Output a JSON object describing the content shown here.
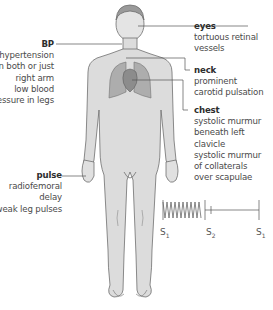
{
  "diagram": {
    "labels": [
      {
        "id": "eyes",
        "heading": "eyes",
        "text": "tortuous retinal\nvessels",
        "side": "right"
      },
      {
        "id": "neck",
        "heading": "neck",
        "text": "prominent\ncarotid pulsation",
        "side": "right"
      },
      {
        "id": "chest",
        "heading": "chest",
        "text": "systolic murmur\nbeneath left\nclavicle\nsystolic murmur\nof collaterals\nover scapulae",
        "side": "right"
      },
      {
        "id": "bp",
        "heading": "BP",
        "text": "hypertension\nin both or just\nright arm\nlow blood\npressure in legs",
        "side": "left"
      },
      {
        "id": "pulse",
        "heading": "pulse",
        "text": "radiofemoral\ndelay\nweak leg pulses",
        "side": "left"
      }
    ],
    "phonocardiogram": {
      "markers": [
        {
          "label": "S",
          "sub": "1"
        },
        {
          "label": "S",
          "sub": "2"
        },
        {
          "label": "S",
          "sub": "1"
        }
      ],
      "murmur": "systolic crescendo-free murmur from S1 to S2"
    },
    "colors": {
      "body_fill": "#dcdcdc",
      "body_stroke": "#6e6e6e",
      "lungs_fill": "#a8a8a8",
      "line": "#555555",
      "text": "#4a4a4a"
    }
  }
}
